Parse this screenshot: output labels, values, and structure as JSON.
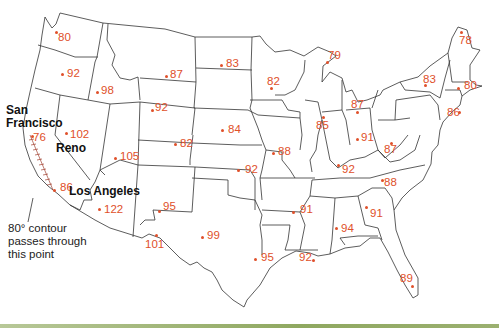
{
  "map": {
    "stroke_color": "#333333",
    "temperature_color": "#e0502a",
    "temperatures": [
      {
        "value": "80",
        "x": 58,
        "y": 31,
        "dx": 55,
        "dy": 31
      },
      {
        "value": "92",
        "x": 67,
        "y": 67,
        "dx": 61,
        "dy": 73
      },
      {
        "value": "98",
        "x": 101,
        "y": 84,
        "dx": 96,
        "dy": 91
      },
      {
        "value": "87",
        "x": 170,
        "y": 68,
        "dx": 165,
        "dy": 75
      },
      {
        "value": "83",
        "x": 226,
        "y": 57,
        "dx": 220,
        "dy": 64
      },
      {
        "value": "79",
        "x": 328,
        "y": 49,
        "dx": 326,
        "dy": 61
      },
      {
        "value": "78",
        "x": 459,
        "y": 34,
        "dx": 460,
        "dy": 31
      },
      {
        "value": "82",
        "x": 267,
        "y": 75,
        "dx": 270,
        "dy": 87
      },
      {
        "value": "83",
        "x": 423,
        "y": 73,
        "dx": 424,
        "dy": 84
      },
      {
        "value": "80",
        "x": 464,
        "y": 79,
        "dx": 457,
        "dy": 87
      },
      {
        "value": "86",
        "x": 447,
        "y": 106,
        "dx": 458,
        "dy": 111
      },
      {
        "value": "87",
        "x": 351,
        "y": 98,
        "dx": 356,
        "dy": 111
      },
      {
        "value": "92",
        "x": 155,
        "y": 101,
        "dx": 151,
        "dy": 109
      },
      {
        "value": "84",
        "x": 228,
        "y": 123,
        "dx": 221,
        "dy": 129
      },
      {
        "value": "85",
        "x": 316,
        "y": 119,
        "dx": 322,
        "dy": 116
      },
      {
        "value": "91",
        "x": 361,
        "y": 131,
        "dx": 356,
        "dy": 138
      },
      {
        "value": "87",
        "x": 384,
        "y": 143,
        "dx": 390,
        "dy": 142
      },
      {
        "value": "82",
        "x": 180,
        "y": 137,
        "dx": 174,
        "dy": 143
      },
      {
        "value": "88",
        "x": 278,
        "y": 145,
        "dx": 272,
        "dy": 152
      },
      {
        "value": "92",
        "x": 342,
        "y": 163,
        "dx": 337,
        "dy": 164
      },
      {
        "value": "88",
        "x": 384,
        "y": 176,
        "dx": 381,
        "dy": 179
      },
      {
        "value": "102",
        "x": 70,
        "y": 128,
        "dx": 65,
        "dy": 132
      },
      {
        "value": "76",
        "x": 33,
        "y": 131,
        "dx": 31,
        "dy": 135
      },
      {
        "value": "105",
        "x": 120,
        "y": 150,
        "dx": 114,
        "dy": 157
      },
      {
        "value": "92",
        "x": 245,
        "y": 163,
        "dx": 237,
        "dy": 169
      },
      {
        "value": "91",
        "x": 300,
        "y": 203,
        "dx": 292,
        "dy": 211
      },
      {
        "value": "86",
        "x": 60,
        "y": 181,
        "dx": 53,
        "dy": 189
      },
      {
        "value": "122",
        "x": 104,
        "y": 203,
        "dx": 98,
        "dy": 208
      },
      {
        "value": "95",
        "x": 163,
        "y": 200,
        "dx": 158,
        "dy": 210
      },
      {
        "value": "91",
        "x": 370,
        "y": 207,
        "dx": 365,
        "dy": 206
      },
      {
        "value": "94",
        "x": 341,
        "y": 222,
        "dx": 335,
        "dy": 227
      },
      {
        "value": "99",
        "x": 207,
        "y": 229,
        "dx": 201,
        "dy": 236
      },
      {
        "value": "101",
        "x": 145,
        "y": 238,
        "dx": 155,
        "dy": 234
      },
      {
        "value": "95",
        "x": 261,
        "y": 251,
        "dx": 254,
        "dy": 258
      },
      {
        "value": "92",
        "x": 299,
        "y": 251,
        "dx": 312,
        "dy": 259
      },
      {
        "value": "89",
        "x": 400,
        "y": 272,
        "dx": 411,
        "dy": 285
      }
    ],
    "cities": [
      {
        "name": "San",
        "x": 6,
        "y": 104
      },
      {
        "name": "Francisco",
        "x": 6,
        "y": 117
      },
      {
        "name": "Reno",
        "x": 56,
        "y": 142
      },
      {
        "name": "Los Angeles",
        "x": 69,
        "y": 185
      }
    ],
    "annotation": {
      "line1": "80° contour",
      "line2": "passes through",
      "line3": "this point"
    }
  }
}
